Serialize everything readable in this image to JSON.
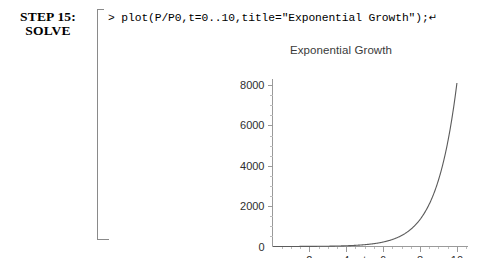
{
  "step": {
    "line1": "STEP 15:",
    "line2": "SOLVE"
  },
  "command": {
    "prompt": "> ",
    "text": "plot(P/P0,t=0..10,title=\"Exponential Growth\");",
    "return_symbol": "↵"
  },
  "chart_data": {
    "type": "line",
    "title": "Exponential Growth",
    "xlabel": "t",
    "ylabel": "",
    "xlim": [
      0,
      10.6
    ],
    "ylim": [
      0,
      8300
    ],
    "grid": false,
    "legend": "none",
    "x_ticks": [
      2,
      4,
      6,
      8,
      10
    ],
    "x_tick_labels": [
      "2",
      "4",
      "6",
      "8",
      "10"
    ],
    "y_ticks": [
      0,
      2000,
      4000,
      6000,
      8000
    ],
    "y_tick_labels": [
      "0",
      "2000",
      "4000",
      "6000",
      "8000"
    ],
    "origin_label": "0",
    "series": [
      {
        "name": "P/P0",
        "expression": "exp(0.9*t)",
        "x": [
          0,
          0.5,
          1,
          1.5,
          2,
          2.5,
          3,
          3.5,
          4,
          4.5,
          5,
          5.5,
          6,
          6.5,
          7,
          7.5,
          8,
          8.5,
          9,
          9.5,
          10
        ],
        "values": [
          1,
          1.57,
          2.46,
          3.86,
          6.05,
          9.49,
          14.9,
          23.3,
          36.6,
          57.4,
          90,
          141,
          221,
          347,
          544,
          854,
          1339,
          2100,
          3294,
          5166,
          8103
        ]
      }
    ]
  }
}
